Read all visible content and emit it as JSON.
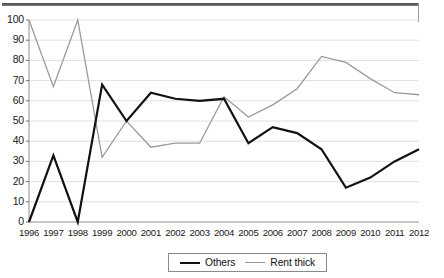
{
  "chart_data": {
    "type": "line",
    "title": "",
    "subtitle": "",
    "xlabel": "",
    "ylabel": "",
    "xlim": [
      1996,
      2012
    ],
    "ylim": [
      0,
      100
    ],
    "ytick_step": 10,
    "grid": true,
    "legend_position": "bottom-center",
    "categories": [
      "1996",
      "1997",
      "1998",
      "1999",
      "2000",
      "2001",
      "2002",
      "2003",
      "2004",
      "2005",
      "2006",
      "2007",
      "2008",
      "2009",
      "2010",
      "2011",
      "2012"
    ],
    "yticks": [
      "0",
      "10",
      "20",
      "30",
      "40",
      "50",
      "60",
      "70",
      "80",
      "90",
      "100"
    ],
    "series": [
      {
        "name": "Others",
        "color": "#111111",
        "width": 2.2,
        "values": [
          0,
          33,
          0,
          68,
          50,
          64,
          61,
          60,
          61,
          39,
          47,
          44,
          36,
          17,
          22,
          30,
          36
        ]
      },
      {
        "name": "Rent thick",
        "color": "#9a9a9a",
        "width": 1.3,
        "values": [
          100,
          67,
          100,
          32,
          50,
          37,
          39,
          39,
          62,
          52,
          58,
          66,
          82,
          79,
          71,
          64,
          63
        ]
      }
    ]
  },
  "legend": {
    "items": [
      {
        "label": "Others",
        "swatch": "line-swatch-black"
      },
      {
        "label": "Rent thick",
        "swatch": "line-swatch-gray"
      }
    ]
  }
}
